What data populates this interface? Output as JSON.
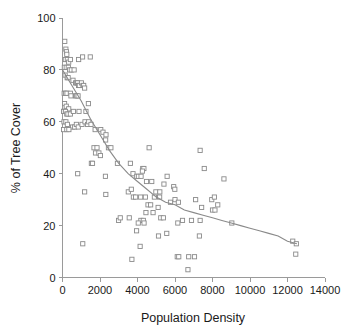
{
  "chart_data": {
    "type": "scatter",
    "title": "",
    "xlabel": "Population Density",
    "ylabel": "% of Tree Cover",
    "xlim": [
      0,
      14000
    ],
    "ylim": [
      0,
      100
    ],
    "xticks": [
      0,
      2000,
      4000,
      6000,
      8000,
      10000,
      12000,
      14000
    ],
    "yticks": [
      0,
      20,
      40,
      60,
      80,
      100
    ],
    "xticklabels": [
      "0",
      "2000",
      "4000",
      "6000",
      "8000",
      "10000",
      "12000",
      "14000"
    ],
    "yticklabels": [
      "0",
      "20",
      "40",
      "60",
      "80",
      "100"
    ],
    "grid": false,
    "legend": null,
    "marker_style": "open-square",
    "marker_color": "#8a8a8a",
    "line_color": "#8a8a8a",
    "points": [
      [
        120,
        91
      ],
      [
        180,
        88
      ],
      [
        210,
        87
      ],
      [
        230,
        86
      ],
      [
        150,
        84
      ],
      [
        260,
        84
      ],
      [
        330,
        83
      ],
      [
        420,
        84
      ],
      [
        860,
        84
      ],
      [
        1070,
        85
      ],
      [
        1480,
        85
      ],
      [
        100,
        81
      ],
      [
        200,
        81
      ],
      [
        310,
        81
      ],
      [
        380,
        80
      ],
      [
        470,
        80
      ],
      [
        620,
        80
      ],
      [
        140,
        78
      ],
      [
        250,
        77
      ],
      [
        300,
        77
      ],
      [
        560,
        76
      ],
      [
        700,
        75
      ],
      [
        760,
        75
      ],
      [
        810,
        75
      ],
      [
        860,
        74
      ],
      [
        900,
        74
      ],
      [
        1010,
        75
      ],
      [
        1090,
        74
      ],
      [
        1130,
        74
      ],
      [
        1180,
        73
      ],
      [
        90,
        71
      ],
      [
        160,
        71
      ],
      [
        240,
        71
      ],
      [
        420,
        71
      ],
      [
        450,
        70
      ],
      [
        700,
        70
      ],
      [
        760,
        70
      ],
      [
        830,
        70
      ],
      [
        110,
        67
      ],
      [
        200,
        66
      ],
      [
        330,
        65
      ],
      [
        60,
        64
      ],
      [
        70,
        64
      ],
      [
        160,
        64
      ],
      [
        230,
        63
      ],
      [
        290,
        63
      ],
      [
        420,
        63
      ],
      [
        580,
        64
      ],
      [
        880,
        64
      ],
      [
        1250,
        64
      ],
      [
        1380,
        67
      ],
      [
        80,
        60
      ],
      [
        180,
        60
      ],
      [
        260,
        59
      ],
      [
        540,
        58
      ],
      [
        650,
        58
      ],
      [
        740,
        59
      ],
      [
        840,
        58
      ],
      [
        1040,
        59
      ],
      [
        1200,
        60
      ],
      [
        1340,
        59
      ],
      [
        1400,
        60
      ],
      [
        1520,
        59
      ],
      [
        60,
        57
      ],
      [
        230,
        57
      ],
      [
        340,
        57
      ],
      [
        1740,
        57
      ],
      [
        2040,
        57
      ],
      [
        2160,
        56
      ],
      [
        2320,
        55
      ],
      [
        2300,
        53
      ],
      [
        1680,
        50
      ],
      [
        1840,
        50
      ],
      [
        2450,
        50
      ],
      [
        2580,
        50
      ],
      [
        4620,
        50
      ],
      [
        7340,
        49
      ],
      [
        1760,
        48
      ],
      [
        1940,
        48
      ],
      [
        2020,
        47
      ],
      [
        1540,
        44
      ],
      [
        1600,
        44
      ],
      [
        2930,
        44
      ],
      [
        3620,
        44
      ],
      [
        7560,
        42
      ],
      [
        4280,
        42
      ],
      [
        4340,
        42
      ],
      [
        4260,
        41
      ],
      [
        3760,
        40
      ],
      [
        2290,
        39
      ],
      [
        3960,
        39
      ],
      [
        4050,
        39
      ],
      [
        4190,
        39
      ],
      [
        5580,
        39
      ],
      [
        810,
        40
      ],
      [
        8610,
        38
      ],
      [
        4480,
        37
      ],
      [
        4760,
        37
      ],
      [
        5410,
        36
      ],
      [
        5930,
        35
      ],
      [
        5990,
        34
      ],
      [
        1180,
        33
      ],
      [
        2310,
        32
      ],
      [
        3510,
        33
      ],
      [
        3670,
        34
      ],
      [
        4980,
        33
      ],
      [
        5190,
        33
      ],
      [
        3780,
        31
      ],
      [
        3900,
        31
      ],
      [
        4170,
        31
      ],
      [
        4420,
        31
      ],
      [
        4900,
        31
      ],
      [
        5180,
        31
      ],
      [
        6000,
        30
      ],
      [
        7100,
        30
      ],
      [
        7960,
        30
      ],
      [
        8100,
        31
      ],
      [
        5760,
        29
      ],
      [
        6180,
        29
      ],
      [
        7420,
        27
      ],
      [
        8280,
        28
      ],
      [
        4560,
        28
      ],
      [
        4700,
        28
      ],
      [
        5100,
        27
      ],
      [
        8000,
        26
      ],
      [
        8130,
        26
      ],
      [
        4450,
        25
      ],
      [
        4830,
        25
      ],
      [
        5240,
        23
      ],
      [
        5380,
        23
      ],
      [
        6400,
        22
      ],
      [
        6880,
        22
      ],
      [
        7340,
        22
      ],
      [
        9030,
        21
      ],
      [
        2990,
        22
      ],
      [
        3080,
        23
      ],
      [
        3560,
        23
      ],
      [
        4180,
        22
      ],
      [
        4310,
        22
      ],
      [
        6150,
        21
      ],
      [
        4040,
        21
      ],
      [
        4350,
        21
      ],
      [
        5120,
        16
      ],
      [
        5560,
        17
      ],
      [
        7300,
        16
      ],
      [
        3950,
        18
      ],
      [
        4140,
        12
      ],
      [
        1080,
        13
      ],
      [
        12280,
        14
      ],
      [
        12470,
        13
      ],
      [
        12440,
        9
      ],
      [
        6120,
        8
      ],
      [
        6200,
        8
      ],
      [
        6730,
        8
      ],
      [
        7040,
        8
      ],
      [
        6690,
        3
      ],
      [
        3700,
        7
      ]
    ],
    "fit_curve": {
      "description": "exponential decay trend",
      "points": [
        [
          0,
          80
        ],
        [
          500,
          74
        ],
        [
          1000,
          68
        ],
        [
          1500,
          61
        ],
        [
          2000,
          55
        ],
        [
          2500,
          49
        ],
        [
          3000,
          44
        ],
        [
          3500,
          40
        ],
        [
          4000,
          37
        ],
        [
          4500,
          34
        ],
        [
          5000,
          31
        ],
        [
          5500,
          29
        ],
        [
          6000,
          28
        ],
        [
          6500,
          26
        ],
        [
          7000,
          25
        ],
        [
          7500,
          24
        ],
        [
          8000,
          23
        ],
        [
          8500,
          22
        ],
        [
          9000,
          21
        ],
        [
          9500,
          20
        ],
        [
          10000,
          19
        ],
        [
          10500,
          18
        ],
        [
          11000,
          17
        ],
        [
          11500,
          16
        ],
        [
          12000,
          14
        ],
        [
          12500,
          13
        ]
      ]
    }
  }
}
